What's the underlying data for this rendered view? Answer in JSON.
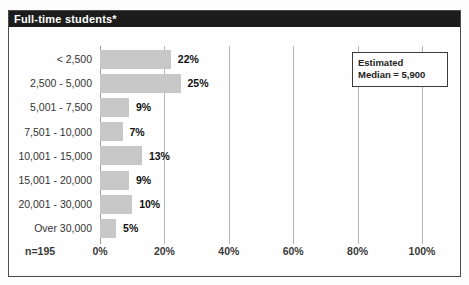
{
  "title": "Full-time students*",
  "sample_size": "n=195",
  "median_box": {
    "line1": "Estimated",
    "line2": "Median = 5,900"
  },
  "colors": {
    "bar": "#c7c7c7",
    "title_bar_bg": "#1c1c1c",
    "title_text": "#ffffff",
    "gridline": "#b5b5b5",
    "frame_border": "#4a4a4a"
  },
  "chart_data": {
    "type": "bar",
    "orientation": "horizontal",
    "title": "Full-time students*",
    "categories": [
      "< 2,500",
      "2,500 - 5,000",
      "5,001 - 7,500",
      "7,501 - 10,000",
      "10,001 - 15,000",
      "15,001 - 20,000",
      "20,001 - 30,000",
      "Over 30,000"
    ],
    "values": [
      22,
      25,
      9,
      7,
      13,
      9,
      10,
      5
    ],
    "value_labels": [
      "22%",
      "25%",
      "9%",
      "7%",
      "13%",
      "9%",
      "10%",
      "5%"
    ],
    "x_tick_values": [
      0,
      20,
      40,
      60,
      80,
      100
    ],
    "x_tick_labels": [
      "0%",
      "20%",
      "40%",
      "60%",
      "80%",
      "100%"
    ],
    "xlim": [
      0,
      100
    ],
    "grid": true,
    "annotation": "Estimated Median = 5,900",
    "sample_size": "n=195",
    "legend": false
  }
}
